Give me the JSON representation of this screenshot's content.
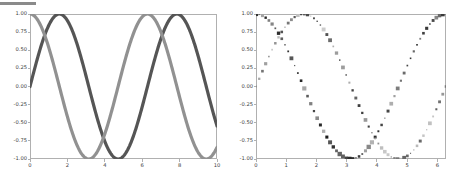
{
  "figure": {
    "background": "#ffffff",
    "top_bar_color": "#8a8a8a",
    "axis_color": "#b0b0b0",
    "tick_label_color": "#3d3d3d"
  },
  "chart_data": [
    {
      "type": "line",
      "title": "",
      "xlabel": "",
      "ylabel": "",
      "xlim": [
        0,
        10
      ],
      "ylim": [
        -1.0,
        1.0
      ],
      "xticks": [
        "0",
        "2",
        "4",
        "6",
        "8",
        "10"
      ],
      "xtick_values": [
        0,
        2,
        4,
        6,
        8,
        10
      ],
      "yticks": [
        "1.00",
        "0.75",
        "0.50",
        "0.25",
        "0.00",
        "-0.25",
        "-0.50",
        "-0.75",
        "-1.00"
      ],
      "ytick_values": [
        1.0,
        0.75,
        0.5,
        0.25,
        0.0,
        -0.25,
        -0.5,
        -0.75,
        -1.0
      ],
      "grid": false,
      "legend": "none",
      "series": [
        {
          "name": "sin(x)",
          "color": "#555555",
          "linewidth": 3.2,
          "function": "sin",
          "x_start": 0,
          "x_end": 10,
          "samples": 400,
          "y_at_x0": 0.0
        },
        {
          "name": "cos(x)",
          "color": "#919191",
          "linewidth": 3.2,
          "function": "cos",
          "x_start": 0,
          "x_end": 10,
          "samples": 400,
          "y_at_x0": 1.0
        }
      ]
    },
    {
      "type": "scatter",
      "title": "",
      "xlabel": "",
      "ylabel": "",
      "xlim": [
        0,
        6.2831853
      ],
      "ylim": [
        -1.0,
        1.0
      ],
      "xticks": [
        "0",
        "1",
        "2",
        "3",
        "4",
        "5",
        "6"
      ],
      "xtick_values": [
        0,
        1,
        2,
        3,
        4,
        5,
        6
      ],
      "yticks": [
        "1.00",
        "0.75",
        "0.50",
        "0.25",
        "0.00",
        "-0.25",
        "-0.50",
        "-0.75",
        "-1.00"
      ],
      "ytick_values": [
        1.0,
        0.75,
        0.5,
        0.25,
        0.0,
        -0.25,
        -0.5,
        -0.75,
        -1.0
      ],
      "grid": false,
      "legend": "none",
      "marker": "square",
      "series": [
        {
          "name": "cos(x)",
          "function": "cos",
          "color_range": [
            "#b5b5b5",
            "#1a1a1a"
          ],
          "size_range": [
            1.2,
            4.4
          ],
          "points": 60,
          "x_start": 0,
          "x_end": 6.2831853,
          "y_at_x0": 1.0
        },
        {
          "name": "sin(x)",
          "function": "sin",
          "color_range": [
            "#d0d0d0",
            "#333333"
          ],
          "size_range": [
            1.0,
            4.0
          ],
          "points": 60,
          "x_start": 0,
          "x_end": 6.2831853,
          "y_at_x0": 0.0
        }
      ]
    }
  ],
  "panels": [
    {
      "name": "left-line-plot",
      "left": 30,
      "top": 14,
      "width": 187,
      "height": 145
    },
    {
      "name": "right-scatter-plot",
      "left": 256,
      "top": 14,
      "width": 190,
      "height": 145
    }
  ]
}
